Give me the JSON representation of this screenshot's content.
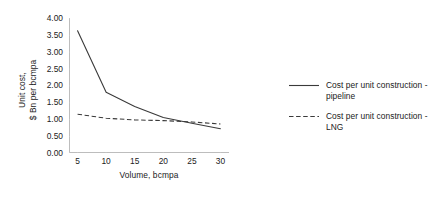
{
  "chart_data": {
    "type": "line",
    "title": "",
    "xlabel": "Volume, bcmpa",
    "ylabel_line1": "Unit cost,",
    "ylabel_line2": "$ Bn per bcmpa",
    "x": [
      5,
      10,
      15,
      20,
      25,
      30
    ],
    "xlim": [
      3.5,
      31.5
    ],
    "ylim": [
      0.0,
      4.0
    ],
    "xticks": [
      "5",
      "10",
      "15",
      "20",
      "25",
      "30"
    ],
    "yticks": [
      "0.00",
      "0.50",
      "1.00",
      "1.50",
      "2.00",
      "2.50",
      "3.00",
      "3.50",
      "4.00"
    ],
    "ytick_values": [
      0.0,
      0.5,
      1.0,
      1.5,
      2.0,
      2.5,
      3.0,
      3.5,
      4.0
    ],
    "grid": false,
    "legend_position": "right",
    "series": [
      {
        "name": "Cost per unit construction - pipeline",
        "label_line1": "Cost per unit construction -",
        "label_line2": "pipeline",
        "style": "solid",
        "color": "#3a3a3a",
        "values": [
          3.62,
          1.8,
          1.38,
          1.05,
          0.88,
          0.72
        ]
      },
      {
        "name": "Cost per unit construction - LNG",
        "label_line1": "Cost per unit construction -",
        "label_line2": "LNG",
        "style": "dashed",
        "color": "#3a3a3a",
        "values": [
          1.15,
          1.03,
          0.98,
          0.96,
          0.92,
          0.86
        ]
      }
    ],
    "axis_color": "#bdbdbd",
    "text_color": "#222222"
  }
}
